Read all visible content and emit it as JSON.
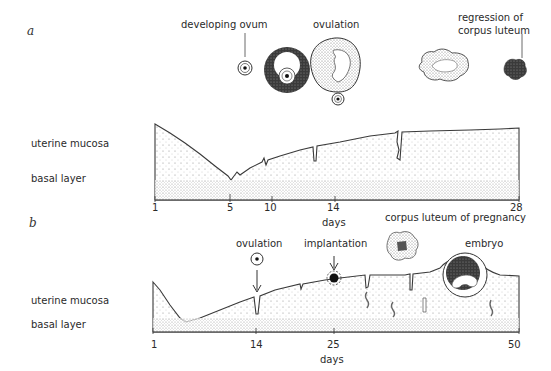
{
  "panel_a": {
    "letter": "a",
    "labels": {
      "developing_ovum": "developing ovum",
      "ovulation": "ovulation",
      "regression_line1": "regression of",
      "regression_line2": "corpus luteum",
      "uterine_mucosa": "uterine mucosa",
      "basal_layer": "basal layer"
    },
    "axis": {
      "ticks": [
        "1",
        "5",
        "10",
        "14",
        "28"
      ],
      "xlabel": "days"
    }
  },
  "panel_b": {
    "letter": "b",
    "labels": {
      "ovulation": "ovulation",
      "implantation": "implantation",
      "corpus_luteum_pregnancy": "corpus luteum of pregnancy",
      "embryo": "embryo",
      "uterine_mucosa": "uterine mucosa",
      "basal_layer": "basal layer"
    },
    "axis": {
      "ticks": [
        "1",
        "14",
        "25",
        "50"
      ],
      "xlabel": "days"
    }
  },
  "colors": {
    "line": "#3a3a3a",
    "stipple": "#9a9a9a",
    "dark_fill": "#3b3b3b"
  }
}
